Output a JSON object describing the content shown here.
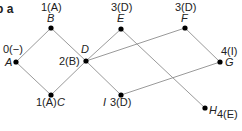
{
  "caption": "b a",
  "nodes": [
    {
      "id": "A",
      "x": 16,
      "y": 62,
      "name": "A",
      "value": "0(−)"
    },
    {
      "id": "B",
      "x": 51,
      "y": 28,
      "name": "B",
      "value": "1(A)"
    },
    {
      "id": "C",
      "x": 51,
      "y": 95,
      "name": "C",
      "value": "1(A)"
    },
    {
      "id": "D",
      "x": 86,
      "y": 61,
      "name": "D",
      "value": "2(B)"
    },
    {
      "id": "E",
      "x": 121,
      "y": 29,
      "name": "E",
      "value": "3(D)"
    },
    {
      "id": "F",
      "x": 185,
      "y": 28,
      "name": "F",
      "value": "3(D)"
    },
    {
      "id": "G",
      "x": 220,
      "y": 62,
      "name": "G",
      "value": "4(I)"
    },
    {
      "id": "I",
      "x": 121,
      "y": 95,
      "name": "I",
      "value": "3(D)"
    },
    {
      "id": "H",
      "x": 205,
      "y": 108,
      "name": "H",
      "value": "4(E)"
    }
  ],
  "edges": [
    [
      "A",
      "B"
    ],
    [
      "A",
      "C"
    ],
    [
      "B",
      "D"
    ],
    [
      "C",
      "D"
    ],
    [
      "D",
      "E"
    ],
    [
      "D",
      "F"
    ],
    [
      "D",
      "I"
    ],
    [
      "E",
      "H"
    ],
    [
      "F",
      "G"
    ],
    [
      "I",
      "G"
    ]
  ],
  "labels": {
    "A_value": "0(−)",
    "A_name": "A",
    "B_value": "1(A)",
    "B_name": "B",
    "C_value": "1(A)",
    "C_name": "C",
    "D_value": "2(B)",
    "D_name": "D",
    "E_value": "3(D)",
    "E_name": "E",
    "F_value": "3(D)",
    "F_name": "F",
    "G_value": "4(I)",
    "G_name": "G",
    "I_value": "3(D)",
    "I_name": "I",
    "H_name": "H",
    "H_sub": "4(E)"
  },
  "colors": {
    "edge": "#9a9a9a",
    "node": "#000000",
    "text": "#222222"
  }
}
